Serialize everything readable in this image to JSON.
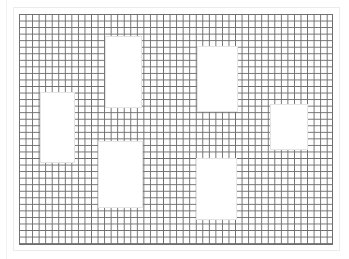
{
  "canvas": {
    "width": 349,
    "height": 259,
    "background": "#ffffff"
  },
  "grid": {
    "left": 19,
    "top": 14,
    "width": 314,
    "height": 231,
    "cell_size": 6.55,
    "line_color": "#6e6e6e"
  },
  "holes": [
    {
      "id": "hole-top-left-center",
      "left": 105,
      "top": 36,
      "width": 37,
      "height": 72
    },
    {
      "id": "hole-top-right-center",
      "left": 197,
      "top": 46,
      "width": 41,
      "height": 66
    },
    {
      "id": "hole-left",
      "left": 40,
      "top": 92,
      "width": 35,
      "height": 71
    },
    {
      "id": "hole-bottom-left-center",
      "left": 98,
      "top": 141,
      "width": 45,
      "height": 67
    },
    {
      "id": "hole-bottom-right-center",
      "left": 196,
      "top": 158,
      "width": 41,
      "height": 62
    },
    {
      "id": "hole-right",
      "left": 270,
      "top": 104,
      "width": 38,
      "height": 46
    }
  ]
}
